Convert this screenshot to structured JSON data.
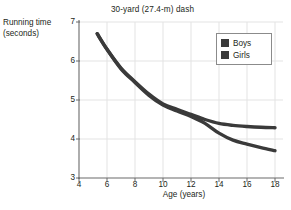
{
  "figure": {
    "clipped_top_text": "",
    "title": "30-yard (27.4-m) dash"
  },
  "axes": {
    "ylabel_line1": "Running time",
    "ylabel_line2": "(seconds)",
    "xlabel": "Age (years)",
    "yticks": [
      "7",
      "6",
      "5",
      "4",
      "3"
    ],
    "xticks": [
      "4",
      "6",
      "8",
      "10",
      "12",
      "14",
      "16",
      "18"
    ]
  },
  "legend": {
    "position": "top-right",
    "entries": [
      {
        "label": "Boys",
        "color": "#3a3a3a"
      },
      {
        "label": "Girls",
        "color": "#3a3a3a"
      }
    ]
  },
  "colors": {
    "boys": "#3a3a3a",
    "girls": "#3a3a3a",
    "grid": "#e3e3e3",
    "axis": "#6b6b6b",
    "text": "#231f20"
  },
  "chart_data": {
    "type": "line",
    "title": "30-yard (27.4-m) dash",
    "xlabel": "Age (years)",
    "ylabel": "Running time (seconds)",
    "xlim": [
      4,
      18
    ],
    "ylim": [
      3,
      7
    ],
    "xticks": [
      4,
      6,
      8,
      10,
      12,
      14,
      16,
      18
    ],
    "yticks": [
      3,
      4,
      5,
      6,
      7
    ],
    "grid": true,
    "legend_position": "top-right",
    "x": [
      5.3,
      6,
      7,
      8,
      9,
      10,
      11,
      12,
      13,
      14,
      15,
      16,
      17,
      18
    ],
    "series": [
      {
        "name": "Boys",
        "color": "#3a3a3a",
        "values": [
          6.7,
          6.3,
          5.8,
          5.45,
          5.12,
          4.87,
          4.72,
          4.58,
          4.4,
          4.15,
          3.97,
          3.87,
          3.78,
          3.7
        ]
      },
      {
        "name": "Girls",
        "color": "#3a3a3a",
        "values": [
          6.7,
          6.3,
          5.82,
          5.47,
          5.15,
          4.9,
          4.76,
          4.63,
          4.5,
          4.4,
          4.35,
          4.32,
          4.3,
          4.29
        ]
      }
    ],
    "annotations": [
      "Curves overlap from age 5 to about age 13, then diverge",
      "Boys continue to improve to about 3.7 s at age 18",
      "Girls level off at about 4.3 s after age 15"
    ]
  }
}
